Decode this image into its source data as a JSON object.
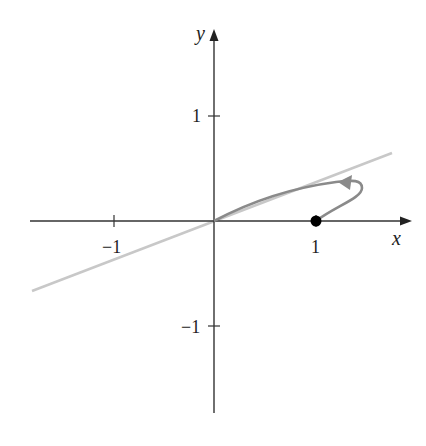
{
  "diagram": {
    "axes": {
      "x_label": "x",
      "y_label": "y",
      "x_ticks": [
        {
          "value": -1,
          "label": "−1"
        },
        {
          "value": 1,
          "label": "1"
        }
      ],
      "y_ticks": [
        {
          "value": 1,
          "label": "1"
        },
        {
          "value": -1,
          "label": "−1"
        }
      ]
    },
    "tangent_line": {
      "color": "#c8c8c8",
      "description": "line through origin"
    },
    "curve": {
      "color": "#8a8a8a",
      "start_point": "(1, 0)",
      "end_point": "(0, 0)",
      "direction": "arrow pointing toward origin"
    },
    "point": {
      "label": "(1, 0)",
      "color": "#000000"
    }
  }
}
